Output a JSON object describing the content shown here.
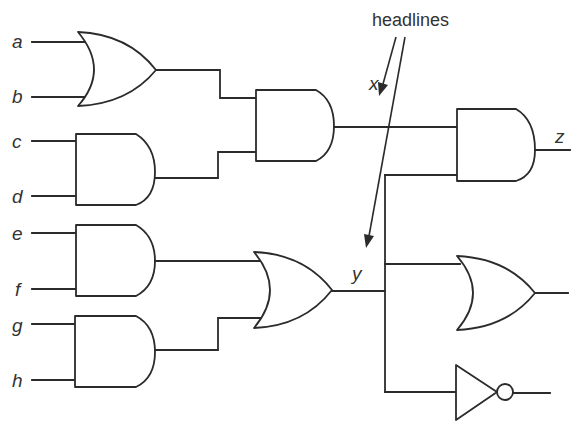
{
  "diagram": {
    "type": "logic-circuit",
    "annotation": "headlines",
    "inputs": [
      "a",
      "b",
      "c",
      "d",
      "e",
      "f",
      "g",
      "h"
    ],
    "intermediate_labels": {
      "x": "x",
      "y": "y"
    },
    "output_label": "z",
    "gates": [
      {
        "id": "g1",
        "kind": "OR",
        "inputs": [
          "a",
          "b"
        ]
      },
      {
        "id": "g2",
        "kind": "AND",
        "inputs": [
          "c",
          "d"
        ]
      },
      {
        "id": "g3",
        "kind": "AND",
        "inputs": [
          "g1",
          "g2"
        ],
        "output": "x"
      },
      {
        "id": "g4",
        "kind": "AND",
        "inputs": [
          "e",
          "f"
        ]
      },
      {
        "id": "g5",
        "kind": "AND",
        "inputs": [
          "g",
          "h"
        ]
      },
      {
        "id": "g6",
        "kind": "OR",
        "inputs": [
          "g4",
          "g5"
        ],
        "output": "y"
      },
      {
        "id": "g7",
        "kind": "AND",
        "inputs": [
          "x",
          "y"
        ],
        "output": "z"
      },
      {
        "id": "g8",
        "kind": "OR",
        "inputs": [
          "y",
          "y"
        ]
      },
      {
        "id": "g9",
        "kind": "NOT",
        "inputs": [
          "y"
        ]
      }
    ],
    "colors": {
      "line": "#2b2b2b",
      "text": "#333333",
      "background": "#ffffff"
    }
  }
}
